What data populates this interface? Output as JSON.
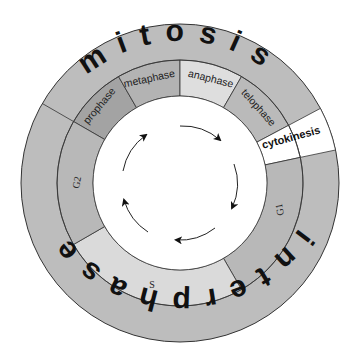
{
  "outer_ring": {
    "mitosis_word": "mitosis",
    "interphase_word": "interphase"
  },
  "phases": {
    "prophase": "prophase",
    "metaphase": "metaphase",
    "anaphase": "anaphase",
    "telophase": "telophase",
    "cytokinesis": "cytokinesis",
    "g1": "G1",
    "s": "S",
    "g2": "G2"
  },
  "colors": {
    "outer_ring": "#bdbdbd",
    "prophase": "#a3a3a3",
    "metaphase": "#b3b3b3",
    "anaphase": "#dedede",
    "telophase": "#bababa",
    "cytokinesis": "#ffffff",
    "g1": "#b8b8b8",
    "s": "#dadada",
    "g2": "#b8b8b8",
    "center": "#ffffff",
    "stroke": "#333333"
  },
  "center_arrows": {
    "count": 5,
    "direction": "clockwise"
  }
}
